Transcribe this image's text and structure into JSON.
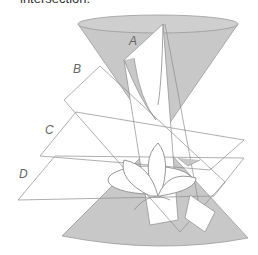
{
  "caption": "intersection.",
  "figure": {
    "labels": [
      {
        "id": "A",
        "text": "A"
      },
      {
        "id": "B",
        "text": "B"
      },
      {
        "id": "C",
        "text": "C"
      },
      {
        "id": "D",
        "text": "D"
      }
    ],
    "colors": {
      "cone_fill": "#c8c8c8",
      "cone_edge": "#9a9a9a",
      "plane_stroke": "#8c8c8c",
      "plane_fill": "#ffffff",
      "label": "#666666"
    }
  }
}
